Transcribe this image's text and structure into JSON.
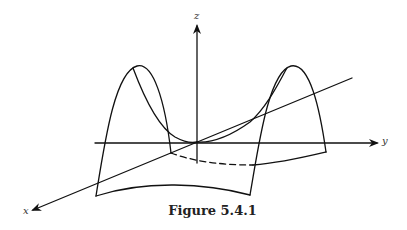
{
  "figure": {
    "caption": "Figure 5.4.1",
    "axes": {
      "x_label": "x",
      "y_label": "y",
      "z_label": "z"
    },
    "colors": {
      "stroke": "#111111",
      "background": "#ffffff"
    }
  }
}
